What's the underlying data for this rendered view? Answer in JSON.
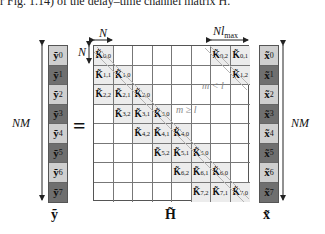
{
  "header_text": "r Fig. 1.14) of the delay–time channel matrix H.",
  "equals_sign": "=",
  "labels": {
    "N_top": "N",
    "N_left": "N",
    "N_lmax": "Nl",
    "lmax_sub": "max",
    "NM_left": "NM",
    "NM_right": "NM",
    "m_less_l": "m < l",
    "m_geq_l": "m ≥ l"
  },
  "vector_y": {
    "symbol": "ỹ",
    "entries": [
      {
        "base": "ỹ",
        "sub": "0",
        "shade": "light"
      },
      {
        "base": "ỹ",
        "sub": "1",
        "shade": "dark"
      },
      {
        "base": "ỹ",
        "sub": "2",
        "shade": "light"
      },
      {
        "base": "ỹ",
        "sub": "3",
        "shade": "dark"
      },
      {
        "base": "ỹ",
        "sub": "4",
        "shade": "light"
      },
      {
        "base": "ỹ",
        "sub": "5",
        "shade": "dark"
      },
      {
        "base": "ỹ",
        "sub": "6",
        "shade": "light"
      },
      {
        "base": "ỹ",
        "sub": "7",
        "shade": "dark"
      }
    ]
  },
  "vector_x": {
    "symbol": "x̃",
    "entries": [
      {
        "base": "x̃",
        "sub": "0",
        "shade": "light"
      },
      {
        "base": "x̃",
        "sub": "1",
        "shade": "dark"
      },
      {
        "base": "x̃",
        "sub": "2",
        "shade": "light"
      },
      {
        "base": "x̃",
        "sub": "3",
        "shade": "dark"
      },
      {
        "base": "x̃",
        "sub": "4",
        "shade": "light"
      },
      {
        "base": "x̃",
        "sub": "5",
        "shade": "dark"
      },
      {
        "base": "x̃",
        "sub": "6",
        "shade": "light"
      },
      {
        "base": "x̃",
        "sub": "7",
        "shade": "dark"
      }
    ]
  },
  "matrix_H": {
    "symbol": "H̃",
    "rows": 8,
    "cols": 8,
    "block_base": "K̃",
    "cells": [
      [
        {
          "sub": "0,0"
        },
        null,
        null,
        null,
        null,
        null,
        {
          "sub": "0,2"
        },
        {
          "sub": "0,1"
        }
      ],
      [
        {
          "sub": "1,1"
        },
        {
          "sub": "1,0"
        },
        null,
        null,
        null,
        null,
        null,
        {
          "sub": "1,2"
        }
      ],
      [
        {
          "sub": "2,2"
        },
        {
          "sub": "2,1"
        },
        {
          "sub": "2,0"
        },
        null,
        null,
        null,
        null,
        null
      ],
      [
        null,
        {
          "sub": "3,2"
        },
        {
          "sub": "3,1"
        },
        {
          "sub": "3,0"
        },
        null,
        null,
        null,
        null
      ],
      [
        null,
        null,
        {
          "sub": "4,2"
        },
        {
          "sub": "4,1"
        },
        {
          "sub": "4,0"
        },
        null,
        null,
        null
      ],
      [
        null,
        null,
        null,
        {
          "sub": "5,2"
        },
        {
          "sub": "5,1"
        },
        {
          "sub": "5,0"
        },
        null,
        null
      ],
      [
        null,
        null,
        null,
        null,
        {
          "sub": "6,2"
        },
        {
          "sub": "6,1"
        },
        {
          "sub": "6,0"
        },
        null
      ],
      [
        null,
        null,
        null,
        null,
        null,
        {
          "sub": "7,2"
        },
        {
          "sub": "7,1"
        },
        {
          "sub": "7,0"
        }
      ]
    ]
  },
  "colors": {
    "light_cell": "#cfcfcf",
    "dark_cell": "#6f6f6f",
    "filled_block": "#ececec",
    "grid_line": "#777777",
    "diagonal_band": "#b5b5b5"
  }
}
